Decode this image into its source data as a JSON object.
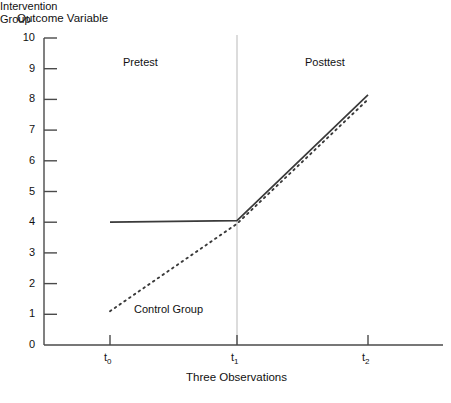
{
  "chart_data": {
    "type": "line",
    "title": "",
    "ylabel": "Outcome Variable",
    "xlabel": "Three Observations",
    "x": [
      "t0",
      "t1",
      "t2"
    ],
    "xtick_labels": [
      "t",
      "t",
      "t"
    ],
    "xtick_subscripts": [
      "0",
      "1",
      "2"
    ],
    "ylim": [
      0,
      10
    ],
    "ytick_labels": [
      "10",
      "9",
      "8",
      "7",
      "6",
      "5",
      "4",
      "3",
      "2",
      "1",
      "0"
    ],
    "ytick_values": [
      10,
      9,
      8,
      7,
      6,
      5,
      4,
      3,
      2,
      1,
      0
    ],
    "grid": false,
    "legend_position": "inline-annotations",
    "series": [
      {
        "name": "Intervention Group",
        "style": "solid",
        "color": "#3a3a3a",
        "values": [
          4.0,
          4.05,
          8.15
        ]
      },
      {
        "name": "Control Group",
        "style": "dotted",
        "color": "#3a3a3a",
        "values": [
          1.1,
          3.95,
          8.0
        ]
      }
    ],
    "annotations": [
      {
        "text": "Pretest",
        "x": "between t0 and t1",
        "y": 9.1
      },
      {
        "text": "Posttest",
        "x": "between t1 and t2",
        "y": 9.1
      },
      {
        "text": "Intervention",
        "x": "t0-t1 region",
        "y": 5.0
      },
      {
        "text": "Group",
        "x": "t0-t1 region",
        "y": 4.6
      },
      {
        "text": "Control Group",
        "x": "near t0",
        "y": 1.1
      }
    ],
    "divider": {
      "at": "t1",
      "orientation": "vertical",
      "color": "#b9b9b9"
    },
    "axis_color": "#4a4a4a"
  },
  "labels": {
    "y_axis_title": "Outcome Variable",
    "x_axis_title": "Three Observations",
    "pretest": "Pretest",
    "posttest": "Posttest",
    "intervention_line1": "Intervention",
    "intervention_line2": "Group",
    "control": "Control Group"
  }
}
